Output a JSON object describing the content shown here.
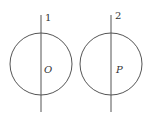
{
  "diagram": {
    "stroke_color": "#555555",
    "figures": [
      {
        "line_label": "1",
        "center_label": "O",
        "circle": {
          "cx": 41,
          "cy": 64,
          "r": 31
        },
        "line": {
          "x": 41,
          "y1": 15,
          "y2": 112
        }
      },
      {
        "line_label": "2",
        "center_label": "P",
        "circle": {
          "cx": 111,
          "cy": 64,
          "r": 31
        },
        "line": {
          "x": 111,
          "y1": 15,
          "y2": 112
        }
      }
    ]
  }
}
